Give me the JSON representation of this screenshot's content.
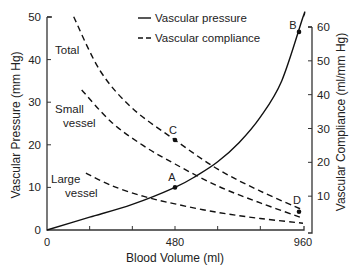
{
  "chart_data": {
    "type": "line",
    "title": "",
    "xlabel": "Blood Volume (ml)",
    "ylabel": "Vascular Pressure (mm Hg)",
    "y2label": "Vascular Compliance (ml/mm Hg)",
    "xlim": [
      0,
      960
    ],
    "ylim": [
      0,
      50
    ],
    "y2lim": [
      0,
      60
    ],
    "xticks": [
      0,
      160,
      320,
      480,
      640,
      800,
      960
    ],
    "xtick_labels": [
      "0",
      "",
      "",
      "480",
      "",
      "",
      "960"
    ],
    "yticks": [
      0,
      10,
      20,
      30,
      40,
      50
    ],
    "y2ticks": [
      10,
      20,
      30,
      40,
      50,
      60
    ],
    "grid": false,
    "legend": [
      {
        "label": "Vascular pressure",
        "style": "solid"
      },
      {
        "label": "Vascular compliance",
        "style": "dashed"
      }
    ],
    "series": [
      {
        "name": "Vascular pressure",
        "axis": "left",
        "style": "solid",
        "x": [
          0,
          160,
          320,
          480,
          560,
          640,
          720,
          800,
          880,
          960
        ],
        "values": [
          0,
          3,
          6,
          10,
          12.7,
          16,
          20.5,
          26.5,
          35,
          50
        ]
      },
      {
        "name": "Total",
        "axis": "right",
        "style": "dashed",
        "x": [
          100,
          200,
          320,
          480,
          640,
          800,
          960
        ],
        "values": [
          63,
          47,
          36,
          26.6,
          18,
          11.5,
          5.9
        ]
      },
      {
        "name": "Small vessel",
        "axis": "right",
        "style": "dashed",
        "x": [
          130,
          240,
          360,
          480,
          640,
          800,
          960
        ],
        "values": [
          41.4,
          32,
          25,
          19.5,
          13,
          8,
          3.5
        ]
      },
      {
        "name": "Large vessel",
        "axis": "right",
        "style": "dashed",
        "x": [
          146,
          240,
          360,
          480,
          640,
          800,
          960
        ],
        "values": [
          16.8,
          13.2,
          10,
          7.7,
          5.2,
          3.4,
          2
        ]
      }
    ],
    "points": [
      {
        "label": "A",
        "x": 480,
        "y": 10,
        "axis": "left"
      },
      {
        "label": "B",
        "x": 945,
        "y": 46.5,
        "axis": "left"
      },
      {
        "label": "C",
        "x": 480,
        "y": 26.6,
        "axis": "right"
      },
      {
        "label": "D",
        "x": 945,
        "y": 5.4,
        "axis": "right"
      }
    ],
    "annotations": [
      "Total",
      "Small vessel",
      "Large vessel"
    ]
  }
}
